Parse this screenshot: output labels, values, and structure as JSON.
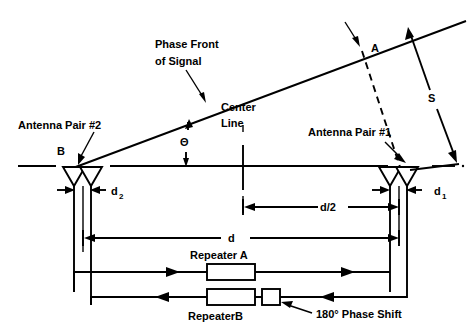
{
  "figure": {
    "type": "technical-diagram",
    "background_color": "#ffffff",
    "line_color": "#000000"
  },
  "labels": {
    "phase_front_line1": "Phase Front",
    "phase_front_line2": "of Signal",
    "center_line_1": "Center",
    "center_line_2": "Line",
    "antenna_pair_2": "Antenna Pair #2",
    "antenna_pair_1": "Antenna Pair #1",
    "point_b": "B",
    "point_a": "A",
    "theta": "Θ",
    "separation_s": "S",
    "d_sub_2_base": "d",
    "d_sub_2_sub": "2",
    "d_sub_1_base": "d",
    "d_sub_1_sub": "1",
    "d_half": "d/2",
    "d_total": "d",
    "repeater_a": "Repeater A",
    "repeater_b": "RepeaterB",
    "phase_shift": "180° Phase Shift"
  },
  "geometry": {
    "baseline_y": 166,
    "antenna_left_x": 85,
    "antenna_right_x": 400,
    "slant_line_from": [
      73,
      167
    ],
    "slant_line_to": [
      462,
      22
    ],
    "center_line_x": 243,
    "d_half_dim_y": 207,
    "d_total_dim_y": 238,
    "repeater_a_y": 272,
    "repeater_b_y": 297
  },
  "colors": {
    "ink": "#000000",
    "paper": "#ffffff"
  }
}
